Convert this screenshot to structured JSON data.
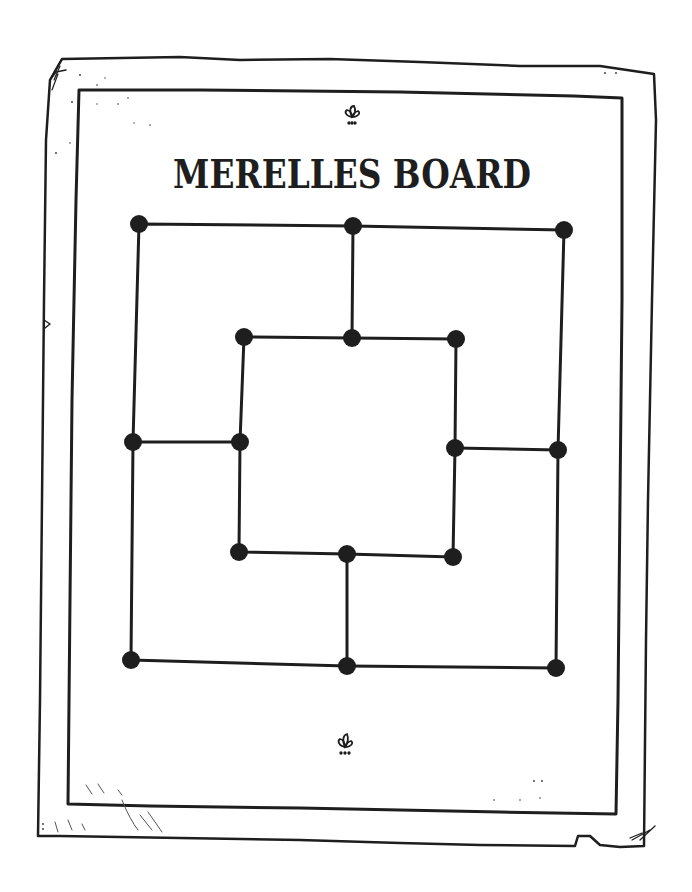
{
  "page": {
    "title": "MERELLES BOARD",
    "ornament_top": "fleuron-icon",
    "ornament_bottom": "fleuron-icon"
  },
  "colors": {
    "ink": "#1e1e1e",
    "paper": "#ffffff"
  },
  "board": {
    "game": "Nine Men's Morris (Merelles)",
    "nodes": [
      {
        "id": "outer-top-left",
        "x": 139,
        "y": 224
      },
      {
        "id": "outer-top-mid",
        "x": 353,
        "y": 226
      },
      {
        "id": "outer-top-right",
        "x": 564,
        "y": 230
      },
      {
        "id": "inner-top-left",
        "x": 244,
        "y": 337
      },
      {
        "id": "inner-top-mid",
        "x": 352,
        "y": 338
      },
      {
        "id": "inner-top-right",
        "x": 456,
        "y": 339
      },
      {
        "id": "outer-mid-left",
        "x": 133,
        "y": 442
      },
      {
        "id": "inner-mid-left",
        "x": 240,
        "y": 442
      },
      {
        "id": "inner-mid-right",
        "x": 455,
        "y": 448
      },
      {
        "id": "outer-mid-right",
        "x": 558,
        "y": 450
      },
      {
        "id": "inner-bottom-left",
        "x": 239,
        "y": 552
      },
      {
        "id": "inner-bottom-mid",
        "x": 347,
        "y": 554
      },
      {
        "id": "inner-bottom-right",
        "x": 453,
        "y": 557
      },
      {
        "id": "outer-bottom-left",
        "x": 131,
        "y": 660
      },
      {
        "id": "outer-bottom-mid",
        "x": 347,
        "y": 666
      },
      {
        "id": "outer-bottom-right",
        "x": 556,
        "y": 668
      }
    ]
  }
}
